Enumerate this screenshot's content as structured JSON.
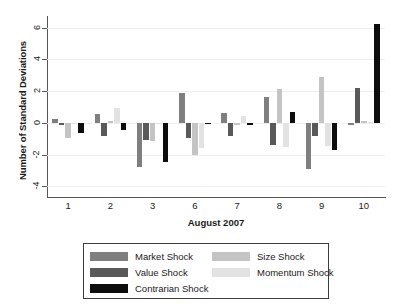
{
  "chart_data": {
    "type": "bar",
    "title": "",
    "xlabel": "August 2007",
    "ylabel": "Number of Standard Deviations",
    "categories": [
      "1",
      "2",
      "3",
      "6",
      "7",
      "8",
      "9",
      "10"
    ],
    "ylim": [
      -4.6,
      6.6
    ],
    "yticks": [
      -4,
      -2,
      0,
      2,
      4,
      6
    ],
    "ytick_labels": [
      "-4",
      "-2",
      "0",
      "2",
      "4",
      "6"
    ],
    "grid": true,
    "legend_position": "bottom",
    "series": [
      {
        "name": "Market Shock",
        "color": "#7f7f7f",
        "values": [
          0.27,
          0.53,
          -2.75,
          1.9,
          0.6,
          1.65,
          -2.9,
          -0.15
        ]
      },
      {
        "name": "Value Shock",
        "color": "#595959",
        "values": [
          -0.13,
          -0.85,
          -1.1,
          -0.95,
          -0.85,
          -1.4,
          -0.8,
          2.2
        ]
      },
      {
        "name": "Size Shock",
        "color": "#c4c4c4",
        "values": [
          -0.95,
          0.12,
          -1.15,
          -2.05,
          -0.12,
          2.12,
          2.9,
          0.1
        ]
      },
      {
        "name": "Momentum Shock",
        "color": "#e2e2e2",
        "values": [
          -0.05,
          0.93,
          -0.08,
          -1.6,
          0.43,
          -1.5,
          -1.45,
          0.05
        ]
      },
      {
        "name": "Contrarian Shock",
        "color": "#0d0d0d",
        "values": [
          -0.62,
          -0.42,
          -2.45,
          -0.02,
          -0.15,
          0.7,
          -1.7,
          6.2
        ]
      }
    ]
  },
  "legend": {
    "columns": [
      {
        "entries": [
          "Market Shock",
          "Value Shock",
          "Contrarian Shock"
        ]
      },
      {
        "entries": [
          "Size Shock",
          "Momentum Shock"
        ]
      }
    ]
  }
}
